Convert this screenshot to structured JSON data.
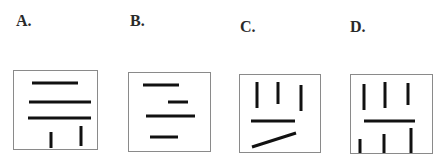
{
  "question": {
    "options": [
      {
        "label": "A.",
        "label_pos": {
          "x": 16,
          "y": 13
        },
        "box": {
          "x": 13,
          "y": 70,
          "w": 85,
          "h": 80
        },
        "lines": [
          {
            "x1": 32,
            "y1": 83,
            "x2": 78,
            "y2": 83
          },
          {
            "x1": 29,
            "y1": 102,
            "x2": 91,
            "y2": 102
          },
          {
            "x1": 28,
            "y1": 118,
            "x2": 91,
            "y2": 118
          },
          {
            "x1": 51,
            "y1": 132,
            "x2": 51,
            "y2": 148
          },
          {
            "x1": 81,
            "y1": 126,
            "x2": 81,
            "y2": 146
          }
        ]
      },
      {
        "label": "B.",
        "label_pos": {
          "x": 130,
          "y": 13
        },
        "box": {
          "x": 128,
          "y": 72,
          "w": 83,
          "h": 80
        },
        "lines": [
          {
            "x1": 143,
            "y1": 85,
            "x2": 179,
            "y2": 85
          },
          {
            "x1": 168,
            "y1": 102,
            "x2": 188,
            "y2": 102
          },
          {
            "x1": 146,
            "y1": 116,
            "x2": 195,
            "y2": 116
          },
          {
            "x1": 150,
            "y1": 137,
            "x2": 178,
            "y2": 137
          }
        ]
      },
      {
        "label": "C.",
        "label_pos": {
          "x": 240,
          "y": 19
        },
        "box": {
          "x": 239,
          "y": 74,
          "w": 82,
          "h": 79
        },
        "lines": [
          {
            "x1": 257,
            "y1": 82,
            "x2": 257,
            "y2": 108
          },
          {
            "x1": 278,
            "y1": 82,
            "x2": 278,
            "y2": 104
          },
          {
            "x1": 301,
            "y1": 85,
            "x2": 301,
            "y2": 111
          },
          {
            "x1": 251,
            "y1": 121,
            "x2": 295,
            "y2": 121
          },
          {
            "x1": 252,
            "y1": 147,
            "x2": 296,
            "y2": 133
          }
        ]
      },
      {
        "label": "D.",
        "label_pos": {
          "x": 350,
          "y": 19
        },
        "box": {
          "x": 350,
          "y": 74,
          "w": 83,
          "h": 80
        },
        "lines": [
          {
            "x1": 364,
            "y1": 84,
            "x2": 364,
            "y2": 110
          },
          {
            "x1": 385,
            "y1": 82,
            "x2": 385,
            "y2": 108
          },
          {
            "x1": 408,
            "y1": 83,
            "x2": 408,
            "y2": 105
          },
          {
            "x1": 364,
            "y1": 121,
            "x2": 415,
            "y2": 121
          },
          {
            "x1": 360,
            "y1": 139,
            "x2": 360,
            "y2": 153
          },
          {
            "x1": 384,
            "y1": 134,
            "x2": 384,
            "y2": 153
          },
          {
            "x1": 411,
            "y1": 128,
            "x2": 411,
            "y2": 153
          }
        ]
      }
    ]
  }
}
